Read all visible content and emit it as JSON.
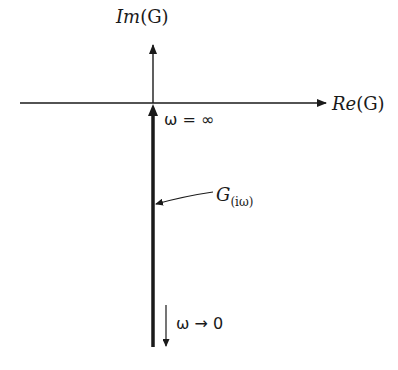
{
  "diagram": {
    "type": "nyquist-plot",
    "axes": {
      "vertical_label_main": "Im",
      "vertical_label_arg": "(G)",
      "horizontal_label_main": "Re",
      "horizontal_label_arg": "(G)"
    },
    "annotations": {
      "omega_infinity": "ω = ∞",
      "curve_label_main": "G",
      "curve_label_sub": "(iω)",
      "omega_to_zero": "ω → 0"
    },
    "colors": {
      "line": "#1a1a1a",
      "background": "#ffffff"
    }
  }
}
